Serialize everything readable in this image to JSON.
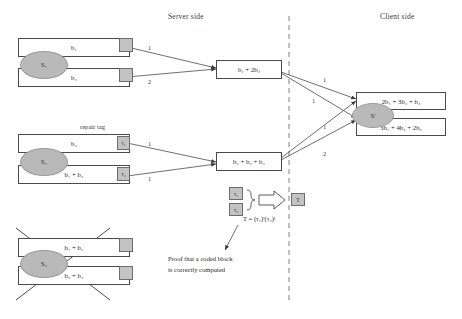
{
  "headers": {
    "server_side": "Server side",
    "client_side": "Client side"
  },
  "annotations": {
    "repair_tag": "repair tag",
    "tag_formula": "T = (τ₁)ⁱ(τ₂)ʲ",
    "proof_line1": "Proof that a coded block",
    "proof_line2": "is correctly computed",
    "combined_tag_label": "T"
  },
  "source_nodes": [
    {
      "id": "s1",
      "label": "S₁",
      "blocks": [
        {
          "text": "b₁",
          "has_tag": true,
          "tag": ""
        },
        {
          "text": "b₂",
          "has_tag": true,
          "tag": ""
        }
      ],
      "failed": false
    },
    {
      "id": "s2",
      "label": "S₂",
      "blocks": [
        {
          "text": "b₃",
          "has_tag": true,
          "tag": "τ₁"
        },
        {
          "text": "b₁ + b₂",
          "has_tag": true,
          "tag": "τ₂"
        }
      ],
      "failed": false
    },
    {
      "id": "s3",
      "label": "S₃",
      "blocks": [
        {
          "text": "b₁ + b₃",
          "has_tag": true,
          "tag": ""
        },
        {
          "text": "b₂ + b₃",
          "has_tag": true,
          "tag": ""
        }
      ],
      "failed": true
    }
  ],
  "server_blocks": [
    {
      "id": "server-block-top",
      "text": "b₁ + 2b₂"
    },
    {
      "id": "server-block-bottom",
      "text": "b₁ + b₂ + b₃"
    }
  ],
  "client": {
    "label": "S'",
    "blocks": [
      {
        "text": "2b₁ + 3b₂ + b₃"
      },
      {
        "text": "3b₁ + 4b₂ + 2b₃"
      }
    ]
  },
  "tag_inputs": [
    {
      "text": "τ₁"
    },
    {
      "text": "τ₂"
    }
  ],
  "edge_labels": {
    "s1_to_server_top": "1",
    "s1_to_server_bottom": "2",
    "s2_to_server_top": "1",
    "s2_to_server_bottom": "1",
    "server_top_to_client_top": "1",
    "server_top_to_client_bottom": "1",
    "server_bottom_to_client_top": "1",
    "server_bottom_to_client_bottom": "2"
  },
  "colors": {
    "line": "#4a4a4a",
    "ellipse_fill": "#b9b9b9",
    "tag_fill": "#c3c3c3",
    "divider": "#6f6f6f",
    "text": "#262626"
  }
}
